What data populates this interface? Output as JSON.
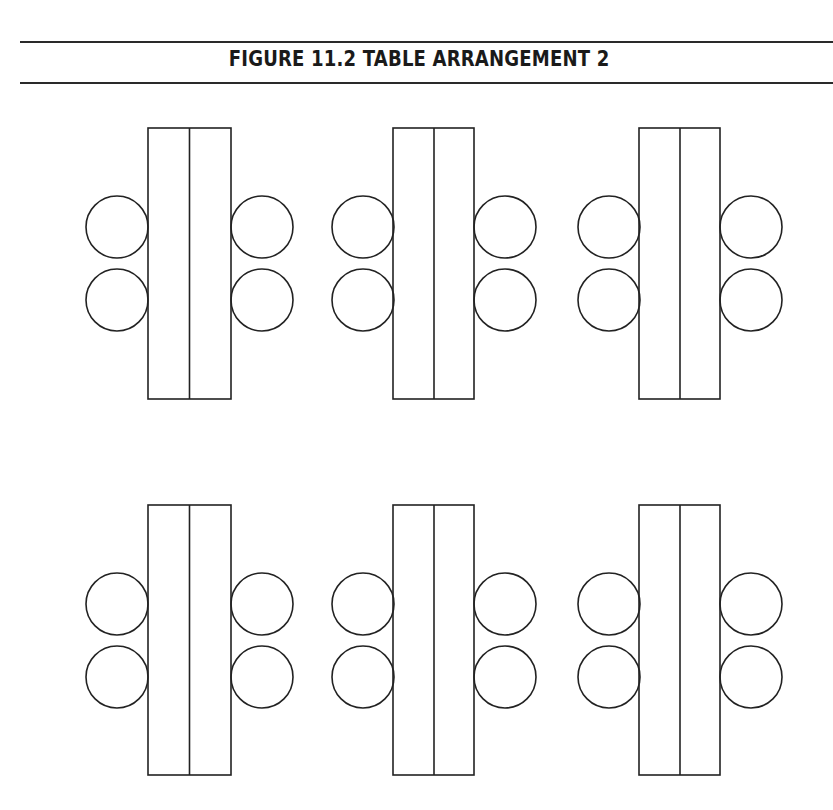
{
  "figure": {
    "title": "FIGURE 11.2  TABLE ARRANGEMENT 2",
    "rows": 2,
    "columns": 3,
    "groups": [
      {
        "label": "table-group-1",
        "row": 1,
        "col": 1,
        "tables": 2,
        "chairs": 4
      },
      {
        "label": "table-group-2",
        "row": 1,
        "col": 2,
        "tables": 2,
        "chairs": 4
      },
      {
        "label": "table-group-3",
        "row": 1,
        "col": 3,
        "tables": 2,
        "chairs": 4
      },
      {
        "label": "table-group-4",
        "row": 2,
        "col": 1,
        "tables": 2,
        "chairs": 4
      },
      {
        "label": "table-group-5",
        "row": 2,
        "col": 2,
        "tables": 2,
        "chairs": 4
      },
      {
        "label": "table-group-6",
        "row": 2,
        "col": 3,
        "tables": 2,
        "chairs": 4
      }
    ],
    "stroke_color": "#222222",
    "background": "#ffffff"
  }
}
